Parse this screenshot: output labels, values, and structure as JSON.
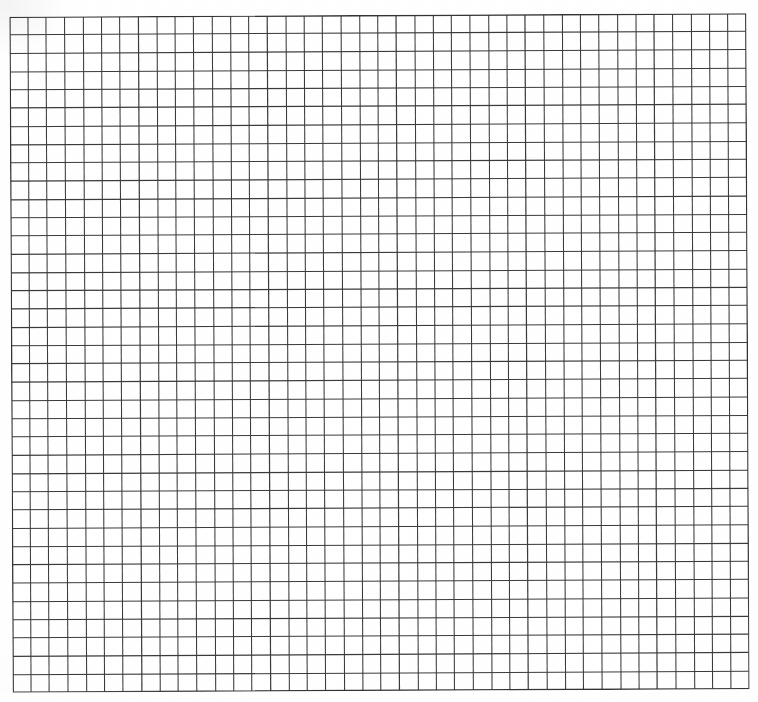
{
  "document": {
    "kind": "grid-paper-scan",
    "title": "Blank graph paper sheet",
    "description": "A scanned blank sheet of square grid (graph) paper with no writing, labels or marks.",
    "text_content": "",
    "annotations": []
  },
  "canvas": {
    "width": 758,
    "height": 702,
    "background_color": "#ffffff"
  },
  "grid": {
    "origin_x": 11,
    "origin_y": 15,
    "width": 737,
    "height": 676,
    "columns": 40,
    "rows": 37,
    "cell_width": 18.42,
    "cell_height": 18.27,
    "line_color": "#3b3b3b",
    "line_width": 1.05,
    "border_color": "#343434",
    "border_width": 1.35,
    "skew_degrees": -0.28,
    "has_major_lines": false,
    "has_labels": false
  },
  "margins": {
    "left": 11,
    "top": 15,
    "right": 10,
    "bottom": 11
  }
}
